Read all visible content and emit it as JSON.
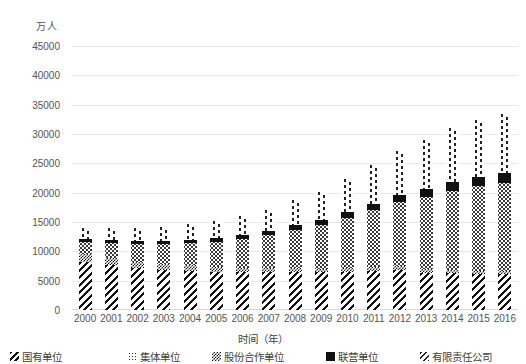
{
  "chart_data": {
    "type": "bar",
    "stacked": true,
    "title": "",
    "unit_label": "万人",
    "xlabel": "时间（年）",
    "ylabel": "",
    "ylim": [
      0,
      45000
    ],
    "ytick_step": 5000,
    "yticks": [
      "0",
      "5000",
      "10000",
      "15000",
      "20000",
      "25000",
      "30000",
      "35000",
      "40000",
      "45000"
    ],
    "grid": true,
    "legend_position": "bottom",
    "categories": [
      "2000",
      "2001",
      "2002",
      "2003",
      "2004",
      "2005",
      "2006",
      "2007",
      "2008",
      "2009",
      "2010",
      "2011",
      "2012",
      "2013",
      "2014",
      "2015",
      "2016"
    ],
    "series": [
      {
        "name": "国有单位",
        "pattern": "diagonal-stripes",
        "values": [
          8102,
          7640,
          7163,
          6876,
          6710,
          6488,
          6430,
          6424,
          6447,
          6420,
          6516,
          6704,
          6839,
          6365,
          6312,
          6208,
          6170
        ]
      },
      {
        "name": "集体单位",
        "pattern": "checker",
        "values": [
          1447,
          1241,
          1071,
          951,
          897,
          810,
          764,
          718,
          662,
          618,
          597,
          567,
          589,
          565,
          527,
          482,
          453
        ]
      },
      {
        "name": "股份合作单位",
        "pattern": "dots",
        "values": [
          2100,
          2500,
          2950,
          3400,
          3800,
          4300,
          4900,
          5600,
          6600,
          7500,
          8600,
          9800,
          11000,
          12300,
          13500,
          14400,
          15100
        ]
      },
      {
        "name": "联营单位",
        "pattern": "solid-black",
        "values": [
          480,
          500,
          520,
          540,
          570,
          600,
          650,
          700,
          780,
          860,
          960,
          1080,
          1200,
          1320,
          1450,
          1520,
          1580
        ]
      },
      {
        "name": "有限责任公司",
        "pattern": "vertical-dashes",
        "values": [
          1900,
          2050,
          2200,
          2400,
          2650,
          2900,
          3250,
          3650,
          4200,
          4800,
          5600,
          6500,
          7400,
          8400,
          9300,
          9800,
          10100
        ]
      }
    ],
    "totals": [
      14029,
      13931,
      13904,
      14167,
      14627,
      15098,
      15994,
      17092,
      18689,
      20198,
      22273,
      24651,
      27028,
      28950,
      31089,
      32410,
      33403
    ]
  }
}
